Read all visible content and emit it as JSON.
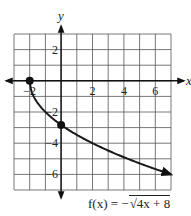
{
  "chart_data": {
    "type": "line",
    "title": "",
    "function_label": "f(x) = −√(4x + 8)",
    "xlabel": "x",
    "ylabel": "y",
    "xlim": [
      -3,
      7
    ],
    "ylim": [
      -7,
      3
    ],
    "grid": true,
    "x_ticks": [
      -2,
      2,
      4,
      6
    ],
    "x_tick_labels": [
      "−2",
      "2",
      "4",
      "6"
    ],
    "y_ticks": [
      2,
      -2,
      -4,
      -6
    ],
    "y_tick_labels": [
      "2",
      "−2",
      "−4",
      "−6"
    ],
    "series": [
      {
        "name": "f(x) = −√(4x + 8)",
        "x": [
          -2,
          -1.5,
          -1,
          0,
          1,
          2,
          3,
          4,
          5,
          6,
          7
        ],
        "y": [
          0,
          -1.41,
          -2,
          -2.83,
          -3.46,
          -4,
          -4.47,
          -4.9,
          -5.29,
          -5.66,
          -6
        ],
        "marked_points": [
          [
            -2,
            0
          ],
          [
            0,
            -2.83
          ]
        ],
        "end_arrow": true
      }
    ],
    "colors": {
      "curve": "#1a1a1a",
      "grid": "#555555",
      "axes": "#111111"
    }
  },
  "labels": {
    "x_axis": "x",
    "y_axis": "y",
    "func_prefix": "f(x) = −",
    "func_radicand": "4x + 8"
  }
}
